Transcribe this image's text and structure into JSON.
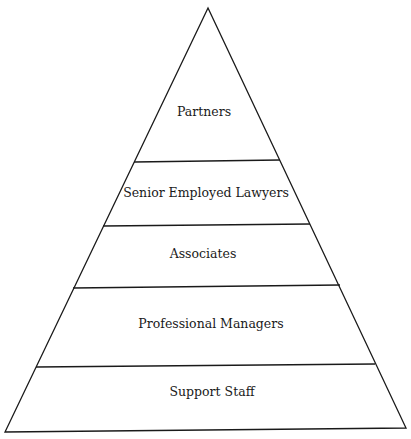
{
  "diagram": {
    "type": "pyramid",
    "stroke_color": "#1a1a1a",
    "background": "#ffffff",
    "tiers": [
      {
        "label": "Partners",
        "position": "top"
      },
      {
        "label": "Senior Employed Lawyers",
        "position": "second"
      },
      {
        "label": "Associates",
        "position": "third"
      },
      {
        "label": "Professional Managers",
        "position": "fourth"
      },
      {
        "label": "Support Staff",
        "position": "base"
      }
    ]
  }
}
